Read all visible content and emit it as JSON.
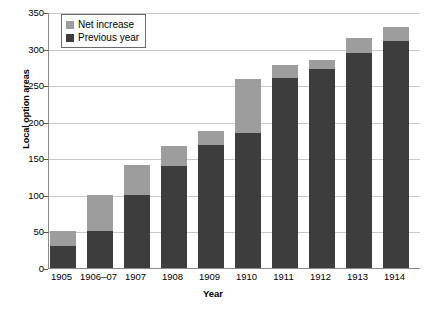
{
  "chart_data": {
    "type": "bar",
    "title": "",
    "subtitle": "",
    "xlabel": "Year",
    "ylabel": "Local option areas",
    "categories": [
      "1905",
      "1906–07",
      "1907",
      "1908",
      "1909",
      "1910",
      "1911",
      "1912",
      "1913",
      "1914"
    ],
    "series": [
      {
        "name": "Previous year",
        "color": "#3d3d3d",
        "values": [
          30,
          50,
          100,
          140,
          168,
          185,
          260,
          272,
          294,
          311
        ]
      },
      {
        "name": "Net increase",
        "color": "#9d9d9d",
        "values": [
          20,
          50,
          41,
          27,
          20,
          74,
          17,
          12,
          21,
          19
        ]
      }
    ],
    "totals": [
      50,
      100,
      141,
      167,
      188,
      259,
      277,
      284,
      315,
      330
    ],
    "stacked": true,
    "ylim": [
      0,
      350
    ],
    "yticks": [
      0,
      50,
      100,
      150,
      200,
      250,
      300,
      350
    ],
    "ytick_labels": [
      "0",
      "50",
      "100",
      "150",
      "200",
      "250",
      "300",
      "350"
    ],
    "grid": true,
    "grid_axis": "y",
    "legend_position": "top-left",
    "legend_entries": [
      "Net increase",
      "Previous year"
    ],
    "bar_width_px": 26,
    "bar_gap_px": 11,
    "background_color": "#ffffff",
    "axis_color": "#8a8a8a",
    "grid_color": "#c8c8c8"
  }
}
